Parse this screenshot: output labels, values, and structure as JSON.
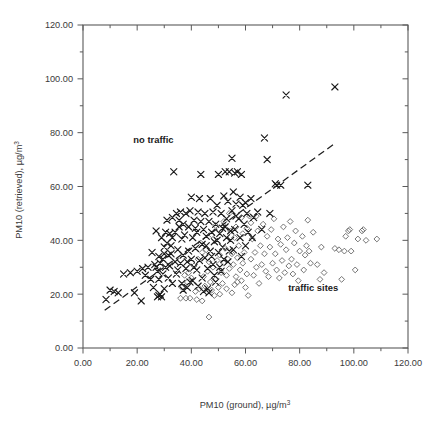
{
  "figure": {
    "background": "#ffffff",
    "frame_color": "#5a5a5a"
  },
  "chart_data": {
    "type": "scatter",
    "title": "",
    "xlabel": "PM10 (ground), µg/m",
    "xlabel_sup": "3",
    "ylabel": "PM10 (retrieved), µg/m",
    "ylabel_sup": "3",
    "xlim": [
      0,
      120
    ],
    "ylim": [
      0,
      120
    ],
    "xticks": [
      0,
      20,
      40,
      60,
      80,
      100,
      120
    ],
    "yticks": [
      0,
      20,
      40,
      60,
      80,
      100,
      120
    ],
    "xtick_labels": [
      "0.00",
      "20.00",
      "40.00",
      "60.00",
      "80.00",
      "100.00",
      "120.00"
    ],
    "ytick_labels": [
      "0.00",
      "20.00",
      "40.00",
      "60.00",
      "80.00",
      "100.00",
      "120.00"
    ],
    "minor_tick_interval": 10,
    "grid": false,
    "legend_position": "inline-annotations",
    "annotations": [
      {
        "text": "no traffic",
        "x": 26,
        "y": 76,
        "name": "annotation-no-traffic"
      },
      {
        "text": "traffic sites",
        "x": 85,
        "y": 21,
        "name": "annotation-traffic-sites"
      }
    ],
    "trendline": {
      "style": "dashed",
      "color": "#1f1f1f",
      "x0": 8.0,
      "y0": 14.0,
      "x1": 93.0,
      "y1": 76.0
    },
    "series": [
      {
        "name": "no traffic",
        "marker": "x",
        "color": "#1a1a1a",
        "points": [
          [
            8.5,
            18.0
          ],
          [
            10.0,
            21.5
          ],
          [
            11.5,
            21.0
          ],
          [
            13.0,
            20.5
          ],
          [
            15.0,
            27.5
          ],
          [
            17.5,
            28.0
          ],
          [
            19.0,
            20.5
          ],
          [
            20.0,
            28.5
          ],
          [
            21.5,
            17.5
          ],
          [
            22.0,
            29.5
          ],
          [
            23.0,
            27.0
          ],
          [
            24.0,
            30.0
          ],
          [
            25.0,
            25.5
          ],
          [
            25.5,
            35.5
          ],
          [
            26.0,
            22.5
          ],
          [
            26.5,
            31.0
          ],
          [
            27.0,
            43.5
          ],
          [
            27.5,
            28.5
          ],
          [
            27.5,
            19.0
          ],
          [
            28.0,
            19.5
          ],
          [
            28.0,
            34.0
          ],
          [
            28.5,
            20.0
          ],
          [
            28.5,
            31.5
          ],
          [
            29.0,
            19.0
          ],
          [
            29.0,
            41.0
          ],
          [
            29.5,
            27.5
          ],
          [
            29.5,
            33.0
          ],
          [
            30.0,
            22.0
          ],
          [
            30.0,
            37.5
          ],
          [
            30.5,
            30.0
          ],
          [
            31.0,
            47.5
          ],
          [
            31.5,
            34.5
          ],
          [
            31.5,
            26.0
          ],
          [
            32.0,
            42.5
          ],
          [
            32.0,
            30.5
          ],
          [
            32.5,
            38.0
          ],
          [
            33.0,
            48.5
          ],
          [
            33.0,
            24.0
          ],
          [
            33.5,
            65.5
          ],
          [
            34.0,
            43.0
          ],
          [
            34.0,
            32.0
          ],
          [
            34.5,
            50.0
          ],
          [
            35.0,
            29.0
          ],
          [
            35.0,
            36.5
          ],
          [
            35.5,
            45.0
          ],
          [
            36.0,
            50.5
          ],
          [
            36.0,
            31.5
          ],
          [
            36.5,
            40.5
          ],
          [
            37.0,
            21.5
          ],
          [
            37.0,
            34.5
          ],
          [
            37.5,
            42.0
          ],
          [
            38.0,
            50.0
          ],
          [
            38.0,
            29.5
          ],
          [
            38.5,
            32.0
          ],
          [
            39.0,
            45.0
          ],
          [
            39.0,
            36.0
          ],
          [
            39.5,
            24.5
          ],
          [
            40.0,
            56.0
          ],
          [
            40.0,
            33.0
          ],
          [
            40.5,
            41.0
          ],
          [
            41.0,
            30.0
          ],
          [
            41.0,
            47.5
          ],
          [
            41.5,
            37.0
          ],
          [
            42.0,
            29.0
          ],
          [
            42.0,
            43.0
          ],
          [
            42.5,
            50.5
          ],
          [
            43.0,
            55.5
          ],
          [
            43.0,
            32.5
          ],
          [
            43.5,
            64.5
          ],
          [
            44.0,
            38.5
          ],
          [
            44.0,
            26.0
          ],
          [
            44.5,
            44.0
          ],
          [
            45.0,
            50.0
          ],
          [
            45.0,
            33.5
          ],
          [
            45.5,
            41.5
          ],
          [
            46.0,
            29.5
          ],
          [
            46.0,
            22.0
          ],
          [
            46.5,
            47.0
          ],
          [
            47.0,
            55.5
          ],
          [
            47.0,
            36.0
          ],
          [
            47.5,
            43.0
          ],
          [
            48.0,
            50.5
          ],
          [
            48.0,
            31.0
          ],
          [
            48.5,
            39.5
          ],
          [
            49.0,
            24.5
          ],
          [
            49.0,
            46.0
          ],
          [
            49.5,
            53.0
          ],
          [
            50.0,
            64.5
          ],
          [
            50.0,
            35.5
          ],
          [
            50.5,
            42.5
          ],
          [
            51.0,
            50.0
          ],
          [
            51.0,
            28.5
          ],
          [
            51.5,
            44.5
          ],
          [
            52.0,
            56.5
          ],
          [
            52.0,
            33.0
          ],
          [
            52.5,
            65.5
          ],
          [
            53.0,
            41.0
          ],
          [
            53.0,
            48.0
          ],
          [
            53.5,
            54.5
          ],
          [
            54.0,
            65.5
          ],
          [
            54.0,
            36.0
          ],
          [
            54.5,
            43.5
          ],
          [
            55.0,
            70.5
          ],
          [
            55.0,
            51.0
          ],
          [
            55.5,
            58.0
          ],
          [
            56.0,
            65.0
          ],
          [
            56.0,
            44.0
          ],
          [
            56.5,
            53.5
          ],
          [
            57.0,
            65.5
          ],
          [
            57.5,
            48.0
          ],
          [
            58.0,
            56.0
          ],
          [
            58.0,
            41.0
          ],
          [
            58.5,
            64.5
          ],
          [
            59.0,
            53.0
          ],
          [
            59.5,
            46.0
          ],
          [
            60.0,
            54.0
          ],
          [
            60.5,
            50.0
          ],
          [
            61.0,
            43.0
          ],
          [
            62.0,
            55.5
          ],
          [
            63.0,
            48.5
          ],
          [
            64.5,
            50.5
          ],
          [
            66.0,
            44.0
          ],
          [
            67.0,
            78.0
          ],
          [
            68.0,
            70.0
          ],
          [
            69.0,
            50.0
          ],
          [
            71.0,
            61.0
          ],
          [
            71.5,
            60.5
          ],
          [
            73.0,
            60.5
          ],
          [
            75.0,
            94.0
          ],
          [
            83.0,
            60.5
          ],
          [
            93.0,
            97.0
          ],
          [
            30.0,
            35.0
          ],
          [
            31.0,
            39.0
          ],
          [
            33.0,
            41.0
          ],
          [
            35.5,
            47.5
          ],
          [
            37.0,
            46.0
          ],
          [
            39.5,
            51.0
          ],
          [
            41.5,
            44.5
          ],
          [
            43.5,
            47.0
          ],
          [
            45.5,
            38.0
          ],
          [
            47.5,
            34.0
          ],
          [
            49.5,
            40.0
          ],
          [
            51.5,
            37.5
          ],
          [
            53.5,
            32.0
          ],
          [
            55.5,
            36.5
          ],
          [
            27.0,
            30.0
          ],
          [
            28.0,
            25.5
          ],
          [
            30.5,
            43.0
          ],
          [
            32.5,
            35.0
          ],
          [
            34.5,
            27.5
          ],
          [
            36.5,
            24.0
          ],
          [
            38.5,
            22.5
          ],
          [
            40.5,
            25.0
          ],
          [
            42.5,
            23.0
          ],
          [
            44.5,
            21.0
          ],
          [
            46.5,
            20.5
          ],
          [
            48.5,
            27.0
          ],
          [
            50.5,
            30.0
          ],
          [
            52.5,
            45.0
          ],
          [
            54.5,
            40.0
          ],
          [
            56.5,
            49.0
          ],
          [
            58.5,
            34.0
          ],
          [
            60.0,
            38.0
          ],
          [
            62.5,
            41.0
          ]
        ]
      },
      {
        "name": "traffic sites",
        "marker": "diamond",
        "color": "#6e6e6e",
        "points": [
          [
            36.0,
            18.5
          ],
          [
            38.0,
            18.5
          ],
          [
            39.5,
            18.5
          ],
          [
            42.0,
            18.0
          ],
          [
            44.0,
            17.5
          ],
          [
            46.5,
            11.5
          ],
          [
            43.0,
            22.0
          ],
          [
            45.0,
            23.0
          ],
          [
            47.0,
            24.5
          ],
          [
            47.5,
            21.5
          ],
          [
            49.0,
            25.5
          ],
          [
            50.0,
            22.5
          ],
          [
            51.0,
            28.0
          ],
          [
            51.5,
            24.0
          ],
          [
            52.0,
            31.5
          ],
          [
            53.0,
            27.0
          ],
          [
            53.5,
            33.0
          ],
          [
            54.0,
            29.5
          ],
          [
            55.0,
            35.0
          ],
          [
            55.5,
            31.0
          ],
          [
            56.0,
            23.5
          ],
          [
            56.5,
            26.5
          ],
          [
            57.0,
            33.5
          ],
          [
            57.5,
            38.0
          ],
          [
            58.0,
            29.0
          ],
          [
            58.5,
            25.0
          ],
          [
            59.0,
            31.5
          ],
          [
            59.5,
            35.5
          ],
          [
            60.0,
            22.5
          ],
          [
            60.5,
            27.5
          ],
          [
            61.0,
            19.5
          ],
          [
            62.0,
            33.0
          ],
          [
            62.5,
            40.5
          ],
          [
            63.0,
            27.0
          ],
          [
            63.5,
            35.5
          ],
          [
            64.0,
            30.0
          ],
          [
            64.5,
            43.5
          ],
          [
            65.0,
            24.0
          ],
          [
            65.5,
            38.0
          ],
          [
            66.0,
            31.0
          ],
          [
            66.5,
            46.0
          ],
          [
            67.0,
            35.0
          ],
          [
            67.5,
            28.5
          ],
          [
            68.0,
            41.5
          ],
          [
            68.5,
            26.5
          ],
          [
            69.0,
            37.5
          ],
          [
            69.5,
            44.0
          ],
          [
            70.0,
            31.5
          ],
          [
            70.5,
            48.0
          ],
          [
            71.0,
            35.0
          ],
          [
            71.5,
            29.0
          ],
          [
            72.0,
            40.5
          ],
          [
            72.5,
            26.0
          ],
          [
            73.0,
            38.5
          ],
          [
            73.5,
            32.5
          ],
          [
            74.0,
            45.0
          ],
          [
            74.5,
            28.0
          ],
          [
            75.0,
            36.5
          ],
          [
            75.5,
            41.0
          ],
          [
            76.0,
            30.5
          ],
          [
            76.5,
            47.0
          ],
          [
            77.0,
            33.0
          ],
          [
            77.5,
            27.5
          ],
          [
            78.0,
            39.0
          ],
          [
            78.5,
            43.5
          ],
          [
            79.0,
            31.0
          ],
          [
            79.5,
            25.0
          ],
          [
            80.0,
            36.0
          ],
          [
            81.0,
            41.5
          ],
          [
            81.5,
            29.0
          ],
          [
            82.0,
            34.5
          ],
          [
            82.5,
            38.0
          ],
          [
            83.0,
            47.5
          ],
          [
            83.5,
            36.0
          ],
          [
            84.0,
            31.5
          ],
          [
            85.0,
            43.0
          ],
          [
            86.5,
            31.0
          ],
          [
            87.5,
            25.5
          ],
          [
            88.0,
            37.5
          ],
          [
            89.0,
            28.0
          ],
          [
            93.0,
            37.0
          ],
          [
            94.5,
            36.5
          ],
          [
            95.5,
            25.5
          ],
          [
            96.5,
            36.0
          ],
          [
            97.0,
            41.5
          ],
          [
            98.0,
            43.5
          ],
          [
            98.5,
            44.0
          ],
          [
            99.0,
            36.0
          ],
          [
            100.5,
            29.0
          ],
          [
            101.5,
            40.5
          ],
          [
            103.0,
            43.5
          ],
          [
            103.5,
            44.0
          ],
          [
            104.5,
            40.0
          ],
          [
            108.5,
            40.5
          ],
          [
            49.5,
            32.5
          ],
          [
            50.5,
            34.5
          ],
          [
            52.5,
            37.0
          ],
          [
            54.5,
            43.5
          ],
          [
            56.5,
            45.0
          ],
          [
            58.5,
            48.5
          ],
          [
            60.5,
            44.5
          ],
          [
            61.5,
            49.0
          ],
          [
            48.0,
            30.0
          ],
          [
            46.0,
            28.5
          ],
          [
            44.5,
            26.5
          ],
          [
            48.5,
            19.5
          ],
          [
            50.5,
            20.0
          ],
          [
            53.0,
            22.0
          ],
          [
            55.0,
            20.5
          ],
          [
            57.0,
            24.5
          ],
          [
            41.0,
            30.5
          ],
          [
            42.5,
            33.0
          ],
          [
            40.0,
            26.0
          ],
          [
            44.0,
            35.5
          ],
          [
            46.5,
            32.0
          ],
          [
            45.5,
            36.5
          ],
          [
            43.5,
            39.0
          ],
          [
            47.5,
            42.0
          ],
          [
            52.0,
            47.0
          ],
          [
            54.0,
            50.0
          ],
          [
            56.0,
            41.0
          ],
          [
            59.0,
            42.5
          ],
          [
            62.0,
            46.5
          ],
          [
            64.0,
            49.0
          ],
          [
            38.5,
            24.5
          ],
          [
            39.0,
            28.0
          ],
          [
            37.5,
            27.0
          ],
          [
            36.5,
            22.5
          ],
          [
            41.5,
            21.0
          ],
          [
            49.0,
            45.5
          ]
        ]
      }
    ]
  }
}
